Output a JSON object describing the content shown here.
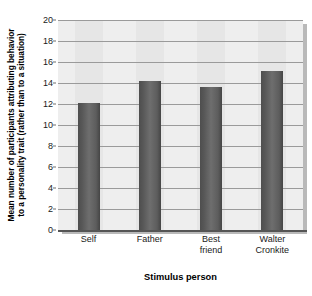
{
  "chart_data": {
    "type": "bar",
    "title": "",
    "categories": [
      "Self",
      "Father",
      "Best friend",
      "Walter Cronkite"
    ],
    "category_lines": [
      [
        "Self"
      ],
      [
        "Father"
      ],
      [
        "Best",
        "friend"
      ],
      [
        "Walter",
        "Cronkite"
      ]
    ],
    "values": [
      12.1,
      14.2,
      13.6,
      15.1
    ],
    "xlabel": "Stimulus person",
    "ylabel": "Mean number of participants attributing behavior to a personality trait (rather than to a situation)",
    "ylabel_lines": [
      "Mean number of participants attributing behavior",
      "to a personality trait (rather than to a situation)"
    ],
    "ylim": [
      0,
      20
    ],
    "ytick_values": [
      0,
      2,
      4,
      6,
      8,
      10,
      12,
      14,
      16,
      18,
      20
    ],
    "ytick_labels": [
      "0",
      "2",
      "4",
      "6",
      "8",
      "10",
      "12",
      "14",
      "16",
      "18",
      "20"
    ],
    "grid": "horizontal",
    "legend": "none",
    "colors": {
      "bar": "#5d5d5d",
      "plot_background": "#eeeeee",
      "band": "#e6e6e6",
      "gridline": "#9a9a9a",
      "axis": "#555555",
      "shadow": "#b9b9b9",
      "text": "#000000"
    }
  }
}
